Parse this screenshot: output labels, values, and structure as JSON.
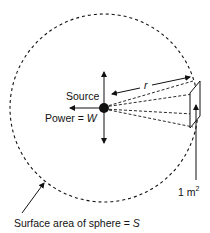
{
  "diagram": {
    "labels": {
      "source": "Source",
      "power_prefix": "Power = ",
      "power_var": "W",
      "radius_var": "r",
      "area_value": "1 m",
      "area_exp": "2",
      "sphere_prefix": "Surface area of sphere = ",
      "sphere_var": "S"
    },
    "colors": {
      "line": "#111111",
      "background": "#ffffff"
    }
  }
}
